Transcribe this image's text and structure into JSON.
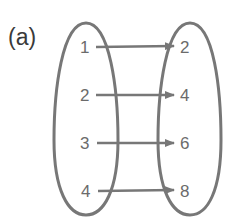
{
  "figure": {
    "label": "(a)",
    "colors": {
      "stroke": "#777777",
      "text": "#6b6b6b",
      "label": "#3a3a3a",
      "background": "#ffffff"
    }
  },
  "mapping": {
    "domain": [
      "1",
      "2",
      "3",
      "4"
    ],
    "range": [
      "2",
      "4",
      "6",
      "8"
    ],
    "arrows": [
      {
        "from": "1",
        "to": "2"
      },
      {
        "from": "2",
        "to": "4"
      },
      {
        "from": "3",
        "to": "6"
      },
      {
        "from": "4",
        "to": "8"
      }
    ]
  }
}
